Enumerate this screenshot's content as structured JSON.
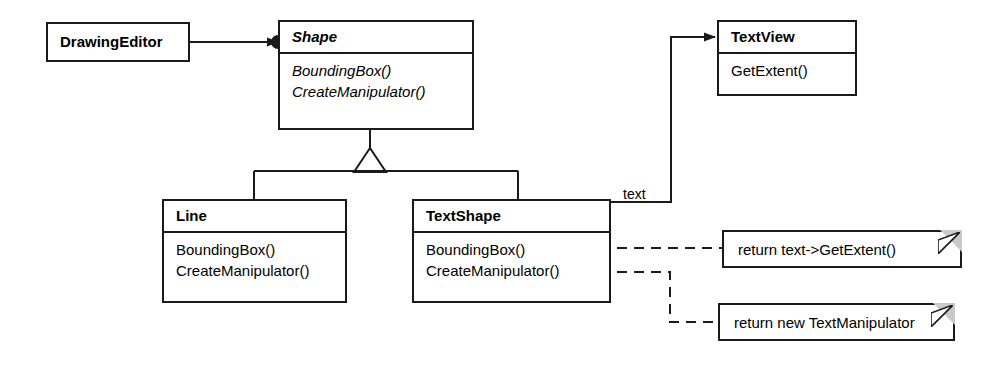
{
  "diagram": {
    "stroke_color": "#1a1a1a",
    "fold_color": "#c9c9c9",
    "background": "#ffffff"
  },
  "classes": {
    "drawing_editor": {
      "name": "DrawingEditor",
      "abstract": false,
      "operations": []
    },
    "shape": {
      "name": "Shape",
      "abstract": true,
      "operations": [
        "BoundingBox()",
        "CreateManipulator()"
      ]
    },
    "text_view": {
      "name": "TextView",
      "abstract": false,
      "operations": [
        "GetExtent()"
      ]
    },
    "line": {
      "name": "Line",
      "abstract": false,
      "operations": [
        "BoundingBox()",
        "CreateManipulator()"
      ]
    },
    "text_shape": {
      "name": "TextShape",
      "abstract": false,
      "operations": [
        "BoundingBox()",
        "CreateManipulator()"
      ]
    }
  },
  "notes": {
    "bounding_box_note": "return text->GetExtent()",
    "create_manipulator_note": "return new TextManipulator"
  },
  "labels": {
    "association_text": "text"
  }
}
